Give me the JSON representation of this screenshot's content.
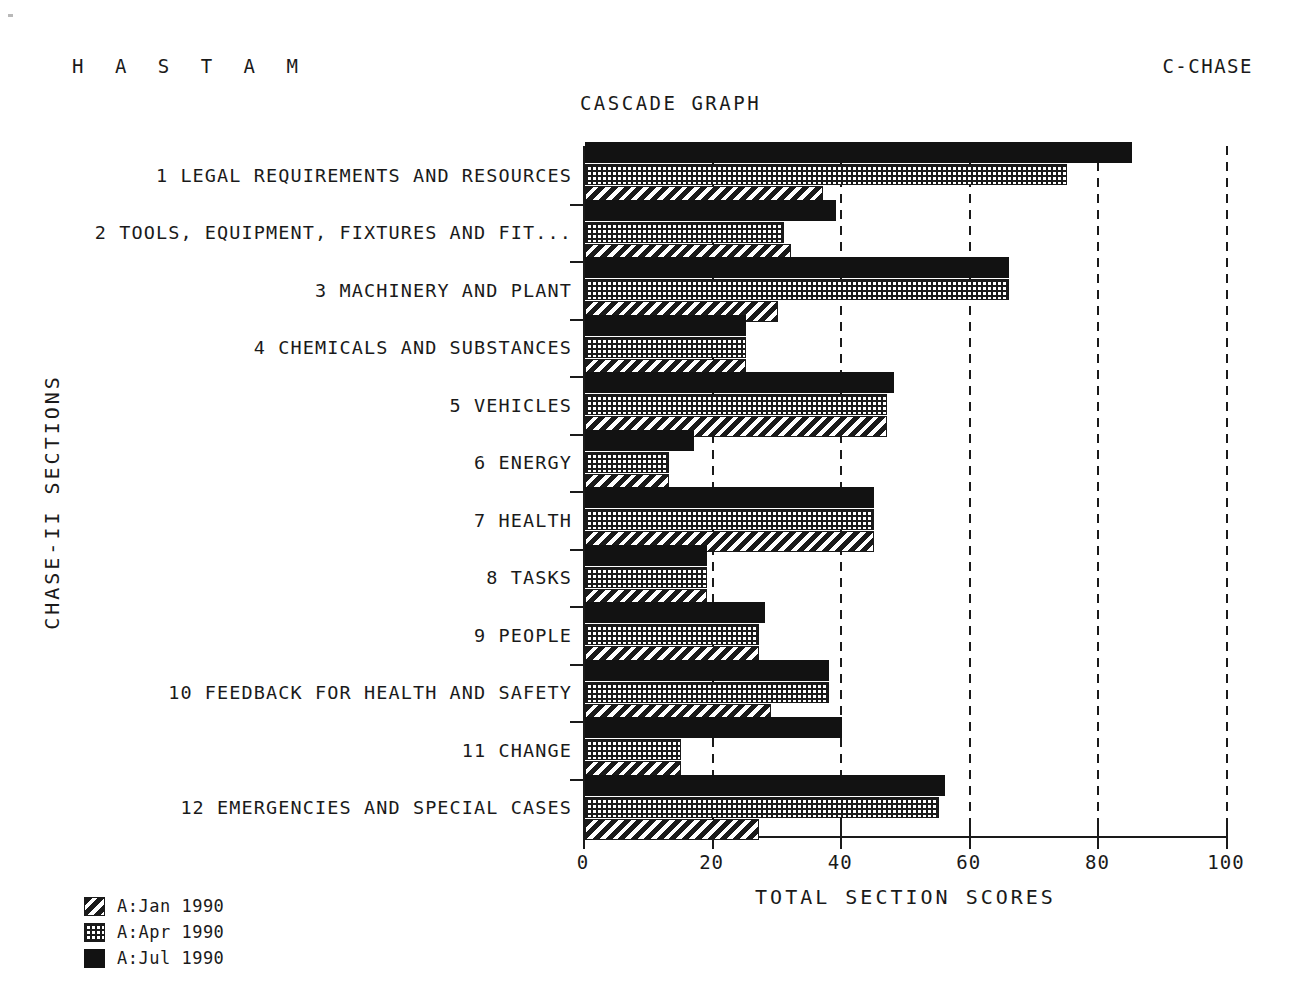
{
  "header": {
    "app_name": "H A S T A M",
    "screen_code": "C-CHASE",
    "title": "CASCADE GRAPH"
  },
  "axes": {
    "x_title": "TOTAL SECTION SCORES",
    "y_title": "CHASE-II SECTIONS",
    "x_ticks": [
      "0",
      "20",
      "40",
      "60",
      "80",
      "100"
    ]
  },
  "legend": {
    "items": [
      {
        "label": "A:Jan 1990",
        "pattern": "diagonal-hatch"
      },
      {
        "label": "A:Apr 1990",
        "pattern": "dotted-grid"
      },
      {
        "label": "A:Jul 1990",
        "pattern": "solid-black"
      }
    ]
  },
  "chart_data": {
    "type": "bar",
    "orientation": "horizontal",
    "title": "CASCADE GRAPH",
    "xlabel": "TOTAL SECTION SCORES",
    "ylabel": "CHASE-II SECTIONS",
    "xlim": [
      0,
      100
    ],
    "xticks": [
      0,
      20,
      40,
      60,
      80,
      100
    ],
    "grid": "vertical-dashed",
    "legend_position": "bottom-left",
    "categories": [
      "1 LEGAL REQUIREMENTS AND RESOURCES",
      "2 TOOLS, EQUIPMENT, FIXTURES AND FIT...",
      "3 MACHINERY AND PLANT",
      "4 CHEMICALS AND SUBSTANCES",
      "5 VEHICLES",
      "6 ENERGY",
      "7 HEALTH",
      "8 TASKS",
      "9 PEOPLE",
      "10 FEEDBACK FOR HEALTH AND SAFETY",
      "11 CHANGE",
      "12 EMERGENCIES AND SPECIAL CASES"
    ],
    "series": [
      {
        "name": "A:Jan 1990",
        "values": [
          37,
          32,
          30,
          25,
          47,
          13,
          45,
          19,
          27,
          29,
          15,
          27
        ]
      },
      {
        "name": "A:Apr 1990",
        "values": [
          75,
          31,
          66,
          25,
          47,
          13,
          45,
          19,
          27,
          38,
          15,
          55
        ]
      },
      {
        "name": "A:Jul 1990",
        "values": [
          85,
          39,
          66,
          25,
          48,
          17,
          45,
          19,
          28,
          38,
          40,
          56
        ]
      }
    ]
  }
}
